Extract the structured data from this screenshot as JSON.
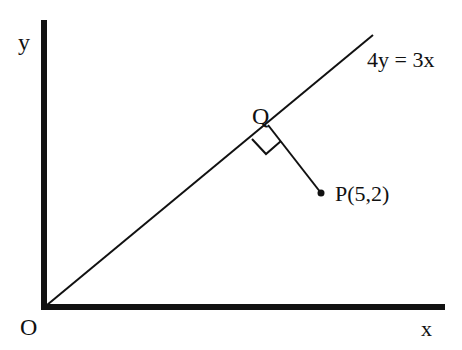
{
  "diagram": {
    "axes": {
      "y_label": "y",
      "x_label": "x",
      "origin_label": "O"
    },
    "line": {
      "equation": "4y = 3x"
    },
    "foot_point": {
      "label": "Q"
    },
    "point": {
      "label": "P(5,2)",
      "x": 5,
      "y": 2
    },
    "right_angle_marker": true
  },
  "colors": {
    "ink": "#111111",
    "background": "#ffffff"
  }
}
